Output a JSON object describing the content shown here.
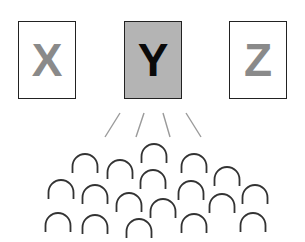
{
  "boxes": [
    {
      "label": "X",
      "x": 18,
      "fill": "#ffffff",
      "text_color": "#8a8a8a"
    },
    {
      "label": "Y",
      "x": 124,
      "fill": "#b4b4b4",
      "text_color": "#0a0a0a"
    },
    {
      "label": "Z",
      "x": 229,
      "fill": "#ffffff",
      "text_color": "#8a8a8a"
    }
  ],
  "rays": [
    {
      "x1": 120,
      "y1": 113,
      "x2": 105,
      "y2": 137
    },
    {
      "x1": 144,
      "y1": 113,
      "x2": 136,
      "y2": 137
    },
    {
      "x1": 163,
      "y1": 113,
      "x2": 170,
      "y2": 137
    },
    {
      "x1": 186,
      "y1": 113,
      "x2": 201,
      "y2": 137
    }
  ],
  "audience_arcs": [
    {
      "cx": 154,
      "top": 144
    },
    {
      "cx": 85,
      "top": 154
    },
    {
      "cx": 120,
      "top": 160
    },
    {
      "cx": 194,
      "top": 154
    },
    {
      "cx": 227,
      "top": 167
    },
    {
      "cx": 153,
      "top": 170
    },
    {
      "cx": 61,
      "top": 180
    },
    {
      "cx": 95,
      "top": 185
    },
    {
      "cx": 191,
      "top": 181
    },
    {
      "cx": 255,
      "top": 185
    },
    {
      "cx": 129,
      "top": 193
    },
    {
      "cx": 163,
      "top": 199
    },
    {
      "cx": 222,
      "top": 194
    },
    {
      "cx": 58,
      "top": 213
    },
    {
      "cx": 95,
      "top": 215
    },
    {
      "cx": 139,
      "top": 219
    },
    {
      "cx": 194,
      "top": 214
    },
    {
      "cx": 253,
      "top": 213
    }
  ],
  "colors": {
    "ray": "#9a9a9a",
    "arc": "#333333",
    "border": "#222222"
  }
}
